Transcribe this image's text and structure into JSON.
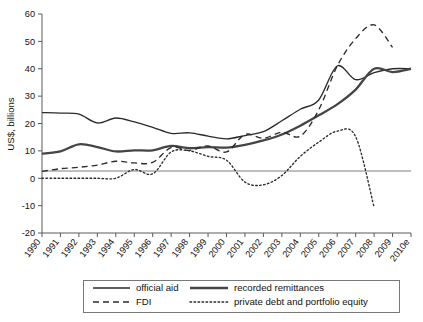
{
  "chart_data": {
    "type": "line",
    "title": "",
    "xlabel": "",
    "ylabel": "US$, billions",
    "ylim": [
      -20,
      60
    ],
    "yticks": [
      -20,
      -10,
      0,
      10,
      20,
      30,
      40,
      50,
      60
    ],
    "ytick_labels": [
      "-20",
      "-10",
      "0",
      "10",
      "20",
      "30",
      "40",
      "50",
      "60"
    ],
    "grid": false,
    "legend_position": "bottom",
    "x": [
      "1990",
      "1991",
      "1992",
      "1993",
      "1994",
      "1995",
      "1996",
      "1997",
      "1998",
      "1999",
      "2000",
      "2001",
      "2002",
      "2003",
      "2004",
      "2005",
      "2006",
      "2007",
      "2008",
      "2009",
      "2010e"
    ],
    "categories": [
      "1990",
      "1991",
      "1992",
      "1993",
      "1994",
      "1995",
      "1996",
      "1997",
      "1998",
      "1999",
      "2000",
      "2001",
      "2002",
      "2003",
      "2004",
      "2005",
      "2006",
      "2007",
      "2008",
      "2009",
      "2010e"
    ],
    "series": [
      {
        "name": "official aid",
        "style": "solid",
        "color": "#2b2b2b",
        "values": [
          24.0,
          23.8,
          23.4,
          20.2,
          22.0,
          20.6,
          18.6,
          16.4,
          16.6,
          15.4,
          14.4,
          15.6,
          17.0,
          21.0,
          25.2,
          28.6,
          41.0,
          36.0,
          38.6,
          40.0,
          40.0
        ]
      },
      {
        "name": "recorded remittances",
        "style": "solid-thick",
        "color": "#454545",
        "values": [
          9.0,
          9.8,
          12.4,
          11.4,
          9.8,
          10.2,
          10.2,
          11.8,
          11.0,
          11.4,
          11.2,
          12.2,
          13.8,
          16.0,
          19.2,
          23.0,
          27.0,
          32.4,
          40.0,
          38.8,
          40.0
        ]
      },
      {
        "name": "FDI",
        "style": "dashed",
        "color": "#2b2b2b",
        "values": [
          2.5,
          3.5,
          4.0,
          4.8,
          6.2,
          5.6,
          5.8,
          11.2,
          10.2,
          11.8,
          9.6,
          16.0,
          14.6,
          16.8,
          15.4,
          25.0,
          41.0,
          51.0,
          56.0,
          47.8,
          null
        ]
      },
      {
        "name": "private debt and portfolio equity",
        "style": "dotted",
        "color": "#2b2b2b",
        "values": [
          0.0,
          0.0,
          0.0,
          0.0,
          0.0,
          3.2,
          1.6,
          9.6,
          10.0,
          8.0,
          6.6,
          -1.4,
          -2.4,
          1.0,
          8.0,
          13.2,
          17.2,
          15.2,
          -10.6,
          null,
          null
        ]
      }
    ]
  },
  "axis": {
    "y_title": "US$, billions"
  },
  "legend": {
    "entries": [
      {
        "label": "official aid",
        "style": "solid"
      },
      {
        "label": "recorded remittances",
        "style": "solid-thick"
      },
      {
        "label": "FDI",
        "style": "dashed"
      },
      {
        "label": "private debt and portfolio equity",
        "style": "dotted"
      }
    ]
  }
}
